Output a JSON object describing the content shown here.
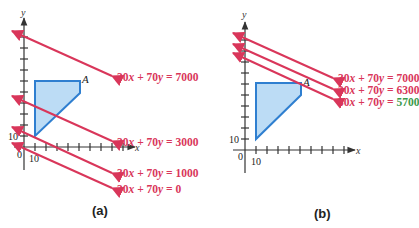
{
  "figure": {
    "panels": [
      {
        "label": "(a)",
        "axes": {
          "x_label": "x",
          "y_label": "y",
          "origin_label": "0",
          "x_tick_label": "10",
          "y_tick_label": "10"
        },
        "feasible_region_vertex_label": "A",
        "lines": [
          {
            "equation": "30x + 70y = 7000",
            "lhs_a": "30",
            "lhs_b": "70",
            "rhs": "7000"
          },
          {
            "equation": "30x + 70y = 3000",
            "lhs_a": "30",
            "lhs_b": "70",
            "rhs": "3000"
          },
          {
            "equation": "30x + 70y = 1000",
            "lhs_a": "30",
            "lhs_b": "70",
            "rhs": "1000"
          },
          {
            "equation": "30x + 70y = 0",
            "lhs_a": "30",
            "lhs_b": "70",
            "rhs": "0"
          }
        ]
      },
      {
        "label": "(b)",
        "axes": {
          "x_label": "x",
          "y_label": "y",
          "origin_label": "0",
          "x_tick_label": "10",
          "y_tick_label": "10"
        },
        "feasible_region_vertex_label": "A",
        "lines": [
          {
            "equation": "30x + 70y = 7000",
            "lhs_a": "30",
            "lhs_b": "70",
            "rhs": "7000"
          },
          {
            "equation": "30x + 70y = 6300",
            "lhs_a": "30",
            "lhs_b": "70",
            "rhs": "6300"
          },
          {
            "equation": "30x + 70y = 5700",
            "lhs_a": "30",
            "lhs_b": "70",
            "rhs": "5700",
            "rhs_color": "#3a9a4a"
          }
        ]
      }
    ],
    "colors": {
      "objective_line": "#d9365a",
      "region_fill": "#bcdcf5",
      "region_stroke": "#2f7fd0",
      "axis": "#333333",
      "highlight_value": "#3a9a4a"
    }
  }
}
